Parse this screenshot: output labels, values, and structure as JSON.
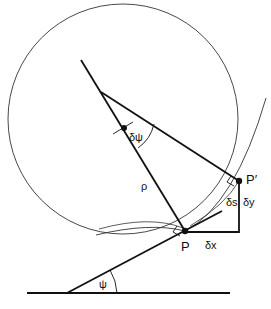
{
  "diagram": {
    "type": "geometry-curvature",
    "labels": {
      "point_p": "P",
      "point_p_prime": "P′",
      "radius": "ρ",
      "delta_psi": "δψ",
      "delta_s": "δs",
      "delta_x": "δx",
      "delta_y": "δy",
      "psi": "ψ"
    },
    "colors": {
      "stroke": "#111111",
      "thin_stroke": "#333333",
      "background": "#ffffff"
    }
  }
}
